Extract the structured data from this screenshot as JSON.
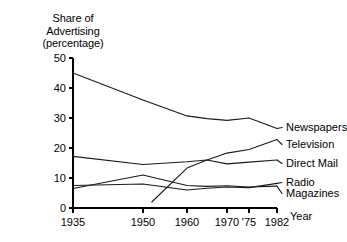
{
  "chart_data": {
    "type": "line",
    "title": "Share of Advertising (percentage)",
    "title_lines": [
      "Share of",
      "Advertising",
      "(percentage)"
    ],
    "xlabel": "Year",
    "ylabel": "Share of Advertising (percentage)",
    "xlim": [
      1935,
      1982
    ],
    "ylim": [
      0,
      50
    ],
    "grid": false,
    "legend_position": "right-inline",
    "x_ticks": [
      {
        "value": 1935,
        "label": "1935"
      },
      {
        "value": 1950,
        "label": "1950"
      },
      {
        "value": 1960,
        "label": "1960"
      },
      {
        "value": 1970,
        "label": "1970"
      },
      {
        "value": 1975,
        "label": "'75"
      },
      {
        "value": 1982,
        "label": "1982"
      }
    ],
    "y_ticks": [
      {
        "value": 0,
        "label": "0"
      },
      {
        "value": 10,
        "label": "10"
      },
      {
        "value": 20,
        "label": "20"
      },
      {
        "value": 30,
        "label": "30"
      },
      {
        "value": 40,
        "label": "40"
      },
      {
        "value": 50,
        "label": "50"
      }
    ],
    "series": [
      {
        "name": "Newspapers",
        "label": "Newspapers",
        "points": [
          [
            1935,
            45.0
          ],
          [
            1950,
            36.0
          ],
          [
            1960,
            30.7
          ],
          [
            1965,
            29.8
          ],
          [
            1970,
            29.2
          ],
          [
            1975,
            30.0
          ],
          [
            1982,
            26.5
          ]
        ]
      },
      {
        "name": "Television",
        "label": "Television",
        "points": [
          [
            1952,
            2.0
          ],
          [
            1960,
            13.3
          ],
          [
            1965,
            16.0
          ],
          [
            1970,
            18.3
          ],
          [
            1975,
            19.5
          ],
          [
            1982,
            22.8
          ]
        ]
      },
      {
        "name": "Direct Mail",
        "label": "Direct Mail",
        "points": [
          [
            1935,
            17.2
          ],
          [
            1950,
            14.5
          ],
          [
            1960,
            15.4
          ],
          [
            1965,
            16.0
          ],
          [
            1970,
            14.7
          ],
          [
            1975,
            15.3
          ],
          [
            1982,
            16.0
          ]
        ]
      },
      {
        "name": "Radio",
        "label": "Radio",
        "points": [
          [
            1935,
            7.5
          ],
          [
            1950,
            8.0
          ],
          [
            1960,
            6.0
          ],
          [
            1965,
            6.6
          ],
          [
            1970,
            7.0
          ],
          [
            1975,
            6.8
          ],
          [
            1982,
            8.2
          ]
        ]
      },
      {
        "name": "Magazines",
        "label": "Magazines",
        "points": [
          [
            1935,
            6.5
          ],
          [
            1950,
            11.0
          ],
          [
            1960,
            7.5
          ],
          [
            1965,
            7.2
          ],
          [
            1970,
            7.4
          ],
          [
            1975,
            7.0
          ],
          [
            1982,
            7.3
          ]
        ]
      }
    ]
  }
}
